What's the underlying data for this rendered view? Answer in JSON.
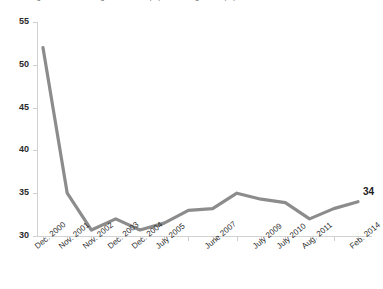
{
  "chart_data": {
    "type": "line",
    "title": "Percentage of adults reading books, newspapers or magazines (%)",
    "xlabel": "",
    "ylabel": "",
    "ylim": [
      30,
      55
    ],
    "yticks": [
      55,
      50,
      45,
      40,
      35,
      30
    ],
    "grid": false,
    "legend": null,
    "line_color": "#8c8c8c",
    "categories": [
      "Dec. 2000",
      "Nov. 2001",
      "Nov. 2002",
      "Dec. 2003",
      "Dec. 2004",
      "July 2005",
      "",
      "June 2007",
      "",
      "July 2009",
      "July 2010",
      "Aug. 2011",
      "",
      "Feb. 2014"
    ],
    "values": [
      52,
      35,
      30.7,
      32,
      30.7,
      31.5,
      33,
      33.2,
      35,
      34.3,
      33.9,
      32,
      33.2,
      34
    ],
    "annotations": [
      {
        "text": "34",
        "value": 34,
        "category": "Feb. 2014"
      }
    ]
  },
  "axes": {
    "y_tick_labels": [
      "55",
      "50",
      "45",
      "40",
      "35",
      "30"
    ],
    "x_tick_labels": [
      "Dec. 2000",
      "Nov. 2001",
      "Nov. 2002",
      "Dec. 2003",
      "Dec. 2004",
      "July 2005",
      "June 2007",
      "July 2009",
      "July 2010",
      "Aug. 2011",
      "Feb. 2014"
    ]
  }
}
